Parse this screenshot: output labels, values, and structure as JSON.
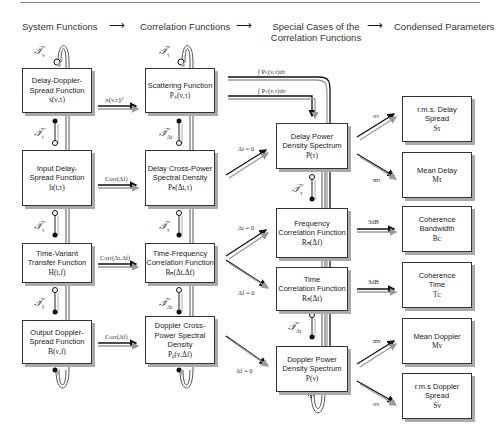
{
  "headers": {
    "col1": "System Functions",
    "col2": "Correlation Functions",
    "col3_line1": "Special Cases of the",
    "col3_line2": "Correlation Functions",
    "col4": "Condensed Parameters",
    "arrow": "⟶"
  },
  "system_functions": [
    {
      "line1": "Delay-Doppler-",
      "line2": "Spread Function",
      "symbol": "s(ν,τ)"
    },
    {
      "line1": "Input Delay-",
      "line2": "Spread Function",
      "symbol": "h(t,τ)"
    },
    {
      "line1": "Time-Variant",
      "line2": "Transfer Function",
      "symbol": "H(t,f)"
    },
    {
      "line1": "Output Doppler-",
      "line2": "Spread Function",
      "symbol": "B(ν,f)"
    }
  ],
  "correlation_functions": [
    {
      "line1": "Scattering Function",
      "line2": "",
      "symbol": "Pₛ(ν,τ)"
    },
    {
      "line1": "Delay Cross-Power",
      "line2": "Spectral Density",
      "symbol": "Pₕ(Δt,τ)"
    },
    {
      "line1": "Time-Frequency",
      "line2": "Correlation Function",
      "symbol": "Rₕ(Δt,Δf)"
    },
    {
      "line1": "Doppler Cross-",
      "line2": "Power Spectral",
      "line3": "Density",
      "symbol": "Pᵦ(ν,Δf)"
    }
  ],
  "special_cases": [
    {
      "line1": "Delay Power",
      "line2": "Density Spectrum",
      "symbol": "P(τ)"
    },
    {
      "line1": "Frequency",
      "line2": "Correlation Function",
      "symbol": "Rₕ(Δf)"
    },
    {
      "line1": "Time",
      "line2": "Correlation Function",
      "symbol": "Rₕ(Δt)"
    },
    {
      "line1": "Doppler Power",
      "line2": "Density Spectrum",
      "symbol": "P(ν)"
    }
  ],
  "condensed_parameters": [
    {
      "line1": "r.m.s. Delay",
      "line2": "Spread",
      "symbol": "Sτ"
    },
    {
      "line1": "Mean Delay",
      "line2": "",
      "symbol": "Mτ"
    },
    {
      "line1": "Coherence",
      "line2": "Bandwidth",
      "symbol": "Bᴄ"
    },
    {
      "line1": "Coherence",
      "line2": "Time",
      "symbol": "Tᴄ"
    },
    {
      "line1": "Mean Doppler",
      "line2": "",
      "symbol": "Mν"
    },
    {
      "line1": "r.m.s Doppler",
      "line2": "Spread",
      "symbol": "Sν"
    }
  ],
  "edge_labels": {
    "row1": "|s(ν,τ)|²",
    "row2": "Corr(Δf)",
    "row3": "Corr(Δt,Δf)",
    "row4": "Corr(Δf)",
    "integral_tau": "∫ Pₛ(ν,τ)dτ",
    "integral_nu": "∫ Pₛ(ν,τ)dν",
    "dt0_a": "Δt = 0",
    "dt0_b": "Δt = 0",
    "df0_a": "Δf = 0",
    "df0_b": "Δf = 0",
    "sigma_tau": "στ",
    "m_tau": "mτ",
    "db3_a": "3dB",
    "db3_b": "3dB",
    "m_nu": "mν",
    "sigma_nu": "σν"
  },
  "transforms": {
    "col1_top": {
      "F": "𝒯",
      "sub": "ν"
    },
    "col1_12": {
      "F": "𝒯",
      "sub": "t"
    },
    "col1_23": {
      "F": "𝒯",
      "sub": "τ"
    },
    "col1_34": {
      "F": "𝒯",
      "sub": "f"
    },
    "col2_top": {
      "F": "𝒯",
      "sub": "τ"
    },
    "col2_12": {
      "F": "𝒯",
      "sub": "Δt"
    },
    "col2_23": {
      "F": "𝒯",
      "sub": "τ"
    },
    "col2_34": {
      "F": "𝒯",
      "sub": "Δt"
    },
    "col3_12": {
      "F": "𝒯",
      "sub": "τ"
    },
    "col3_34": {
      "F": "𝒯",
      "sub": "Δt"
    }
  }
}
